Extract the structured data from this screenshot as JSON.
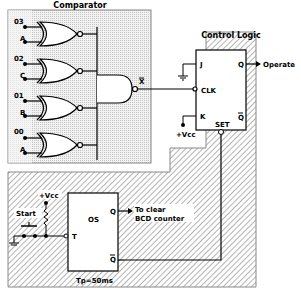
{
  "comparator": {
    "title": "Comparator",
    "inputs": [
      {
        "top": "03",
        "bottom": "A"
      },
      {
        "top": "02",
        "bottom": "C"
      },
      {
        "top": "01",
        "bottom": "B"
      },
      {
        "top": "00",
        "bottom": "A"
      }
    ],
    "output_label": "X"
  },
  "control_logic": {
    "title": "Control Logic",
    "pins": {
      "j": "J",
      "clk": "CLK",
      "k": "K",
      "q": "Q",
      "qbar": "Q",
      "set": "SET"
    },
    "vcc": "+Vcc",
    "output": "Operate"
  },
  "oneshot": {
    "label": "OS",
    "pins": {
      "q": "Q",
      "qbar": "Q",
      "t": "T"
    },
    "vcc": "+Vcc",
    "start": "Start",
    "output_line1": "To clear",
    "output_line2": "BCD counter",
    "pulse": "Tp=50ms"
  },
  "colors": {
    "line": "#000000",
    "dots": "#c8c8c8",
    "hatch": "#555555"
  }
}
